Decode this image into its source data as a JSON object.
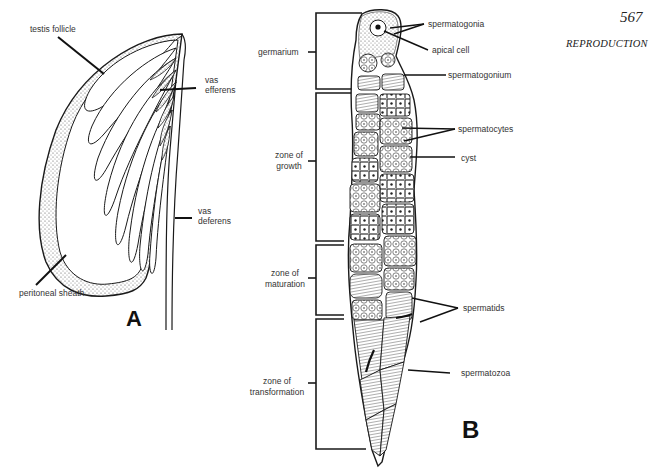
{
  "header": {
    "page_number": "567",
    "section_title": "REPRODUCTION"
  },
  "panel_a": {
    "letter": "A",
    "labels": {
      "testis_follicle": "testis follicle",
      "vas_efferens_1": "vas",
      "vas_efferens_2": "efferens",
      "vas_deferens_1": "vas",
      "vas_deferens_2": "deferens",
      "peritoneal_sheath": "peritoneal sheath"
    }
  },
  "panel_b": {
    "letter": "B",
    "zones": {
      "germarium": "germarium",
      "growth_1": "zone of",
      "growth_2": "growth",
      "maturation_1": "zone of",
      "maturation_2": "maturation",
      "transformation_1": "zone of",
      "transformation_2": "transformation"
    },
    "labels": {
      "spermatogonia": "spermatogonia",
      "apical_cell": "apical cell",
      "spermatogonium": "spermatogonium",
      "spermatocytes": "spermatocytes",
      "cyst": "cyst",
      "spermatids": "spermatids",
      "spermatozoa": "spermatozoa"
    }
  },
  "colors": {
    "ink": "#1a1a1a",
    "stipple": "#bfbfbf",
    "background": "#ffffff"
  }
}
